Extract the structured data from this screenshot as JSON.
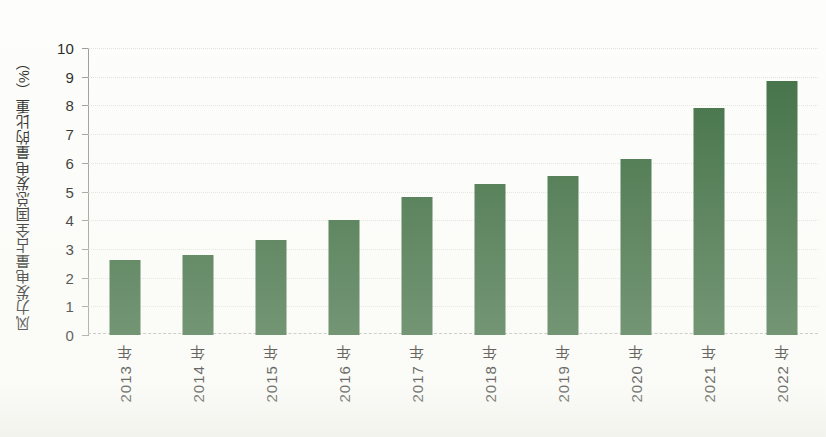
{
  "chart_data": {
    "type": "bar",
    "title": "",
    "subtitle": "",
    "xlabel": "",
    "ylabel": "风力发电量占全国总发电量的比重（%）",
    "categories": [
      "2013 年",
      "2014 年",
      "2015 年",
      "2016 年",
      "2017 年",
      "2018 年",
      "2019 年",
      "2020 年",
      "2021 年",
      "2022 年"
    ],
    "values": [
      2.6,
      2.8,
      3.3,
      4.0,
      4.8,
      5.25,
      5.55,
      6.15,
      7.9,
      8.85
    ],
    "ylim": [
      0,
      10
    ],
    "ytick_labels": [
      "0",
      "1",
      "2",
      "3",
      "4",
      "5",
      "6",
      "7",
      "8",
      "9",
      "10"
    ],
    "ytick_values": [
      0,
      1,
      2,
      3,
      4,
      5,
      6,
      7,
      8,
      9,
      10
    ],
    "grid": true,
    "grid_axis": "y",
    "legend": false,
    "legend_position": "none",
    "series": [
      {
        "name": "风力发电量占全国总发电量的比重",
        "color": "#3a6b3e",
        "values": [
          2.6,
          2.8,
          3.3,
          4.0,
          4.8,
          5.25,
          5.55,
          6.15,
          7.9,
          8.85
        ]
      }
    ]
  },
  "colors": {
    "bar": "#3a6b3e",
    "axis": "#9a9a96",
    "grid": "#d8d8d4",
    "text": "#231f20",
    "background": "#fdfdfb"
  }
}
